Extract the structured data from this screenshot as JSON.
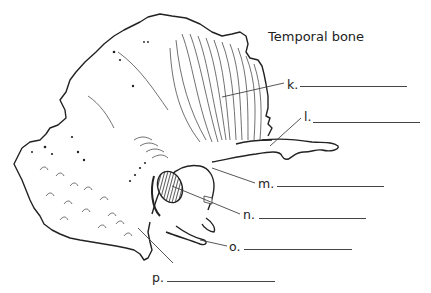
{
  "title": "Temporal bone",
  "labels": [
    {
      "letter": "k.",
      "answer": ""
    },
    {
      "letter": "l.",
      "answer": ""
    },
    {
      "letter": "m.",
      "answer": ""
    },
    {
      "letter": "n.",
      "answer": ""
    },
    {
      "letter": "o.",
      "answer": ""
    },
    {
      "letter": "p.",
      "answer": ""
    }
  ],
  "colors": {
    "line": "#222222",
    "background": "#ffffff",
    "canal_hatch": "#333333"
  }
}
